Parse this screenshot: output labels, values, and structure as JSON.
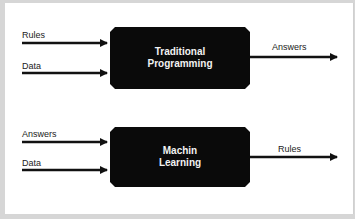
{
  "diagram": {
    "top": {
      "box_line1": "Traditional",
      "box_line2": "Programming",
      "inputs": [
        "Rules",
        "Data"
      ],
      "output": "Answers"
    },
    "bottom": {
      "box_line1": "Machin",
      "box_line2": "Learning",
      "inputs": [
        "Answers",
        "Data"
      ],
      "output": "Rules"
    },
    "colors": {
      "box": "#0a0a0a",
      "box_text": "#f2f2f2",
      "arrow": "#111111",
      "frame": "#d6d6d6"
    }
  }
}
